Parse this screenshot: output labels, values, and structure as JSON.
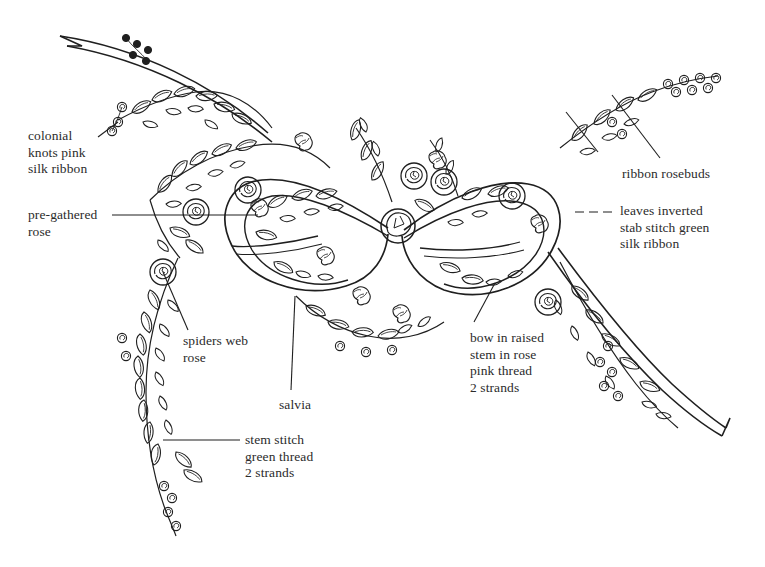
{
  "page": {
    "width": 765,
    "height": 567,
    "background_color": "#ffffff",
    "ink_color": "#1f1f1f",
    "text_color": "#2b2b2b"
  },
  "labels": [
    {
      "id": "colonial-knots",
      "lines": [
        "colonial",
        "knots pink",
        "silk ribbon"
      ],
      "text": "colonial\nknots pink\nsilk ribbon",
      "x": 28,
      "y": 128,
      "align": "left",
      "leader": {
        "type": "line",
        "points": "98,137 118,122"
      }
    },
    {
      "id": "pre-gathered-rose",
      "lines": [
        "pre-gathered",
        "rose"
      ],
      "text": "pre-gathered\nrose",
      "x": 28,
      "y": 207,
      "align": "left",
      "leader": {
        "type": "line",
        "points": "112,215 258,215"
      }
    },
    {
      "id": "spiders-web-rose",
      "lines": [
        "spiders web",
        "rose"
      ],
      "text": "spiders web\nrose",
      "x": 183,
      "y": 333,
      "align": "left",
      "leader": {
        "type": "line",
        "points": "188,332 163,272"
      }
    },
    {
      "id": "salvia",
      "lines": [
        "salvia"
      ],
      "text": "salvia",
      "x": 279,
      "y": 397,
      "align": "left",
      "leader": {
        "type": "line",
        "points": "291,392 295,296"
      }
    },
    {
      "id": "stem-stitch",
      "lines": [
        "stem stitch",
        "green thread",
        "2 strands"
      ],
      "text": "stem stitch\ngreen thread\n2 strands",
      "x": 245,
      "y": 432,
      "align": "left",
      "leader": {
        "type": "line",
        "points": "240,440 163,440"
      }
    },
    {
      "id": "bow-in-raised-stem",
      "lines": [
        "bow in raised",
        "stem in rose",
        "pink thread",
        "2 strands"
      ],
      "text": "bow in raised\nstem in rose\npink thread\n2 strands",
      "x": 470,
      "y": 330,
      "align": "left",
      "leader": {
        "type": "line",
        "points": "474,322 495,283"
      }
    },
    {
      "id": "ribbon-rosebuds",
      "lines": [
        "ribbon rosebuds"
      ],
      "text": "ribbon rosebuds",
      "x": 622,
      "y": 166,
      "align": "left",
      "leader": {
        "type": "line",
        "points": "660,160 612,95"
      }
    },
    {
      "id": "leaves-inverted",
      "lines": [
        "leaves inverted",
        "stab stitch green",
        "silk ribbon"
      ],
      "text": "leaves inverted\nstab stitch green\nsilk ribbon",
      "x": 620,
      "y": 203,
      "align": "left",
      "leader": {
        "type": "dashed",
        "points": "612,212 575,212"
      }
    }
  ],
  "motifs": {
    "bow": "central double-loop bow tied with a rose knot at the centre",
    "tails": [
      "upper-left ribbon tail with notched end",
      "lower-right ribbon tail with notched end"
    ],
    "branches": [
      "upper-right leafy spray",
      "lower-left trailing leafy spray"
    ],
    "flowers": [
      "spiders web rose",
      "pre-gathered rose",
      "salvia clusters",
      "ribbon rosebuds",
      "colonial knots"
    ]
  }
}
